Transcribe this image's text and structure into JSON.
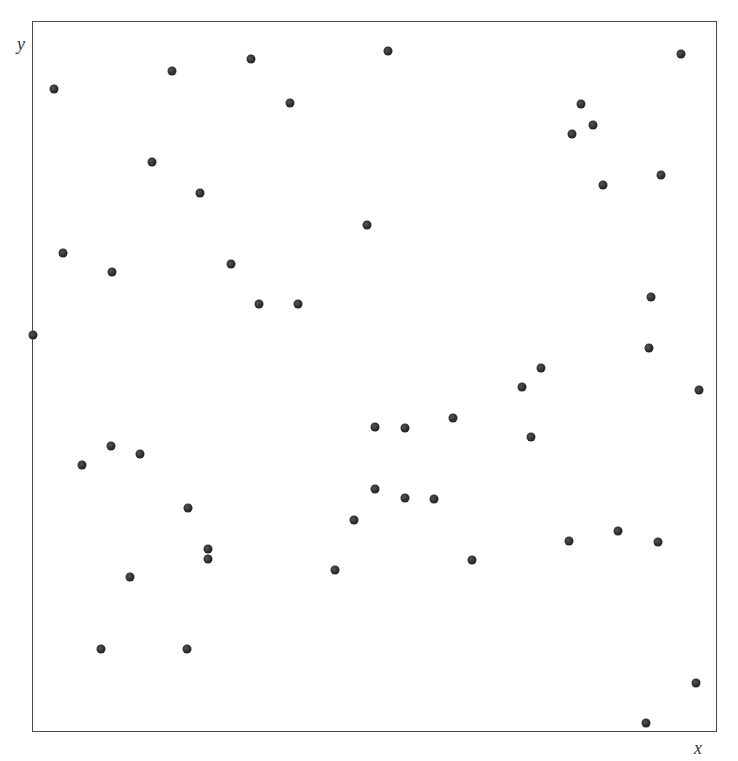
{
  "chart_data": {
    "type": "scatter",
    "title": "",
    "xlabel": "x",
    "ylabel": "y",
    "xlim": [
      0,
      1
    ],
    "ylim": [
      0,
      1
    ],
    "grid": false,
    "legend": null,
    "ticks": {
      "x": [],
      "y": []
    },
    "marker": {
      "shape": "circle",
      "color": "#2a2a2a",
      "size_px": 9
    },
    "frame": {
      "left": 32,
      "top": 21,
      "width": 685,
      "height": 711,
      "border_color": "#4a4a4a"
    },
    "points": [
      {
        "x": 0.032,
        "y": 0.904
      },
      {
        "x": 0.204,
        "y": 0.93
      },
      {
        "x": 0.32,
        "y": 0.947
      },
      {
        "x": 0.377,
        "y": 0.885
      },
      {
        "x": 0.175,
        "y": 0.802
      },
      {
        "x": 0.245,
        "y": 0.758
      },
      {
        "x": 0.489,
        "y": 0.713
      },
      {
        "x": 0.045,
        "y": 0.674
      },
      {
        "x": 0.117,
        "y": 0.647
      },
      {
        "x": 0.291,
        "y": 0.658
      },
      {
        "x": 0.331,
        "y": 0.602
      },
      {
        "x": 0.388,
        "y": 0.602
      },
      {
        "x": 0.52,
        "y": 0.958
      },
      {
        "x": 0.947,
        "y": 0.954
      },
      {
        "x": 0.801,
        "y": 0.883
      },
      {
        "x": 0.819,
        "y": 0.854
      },
      {
        "x": 0.788,
        "y": 0.841
      },
      {
        "x": 0.918,
        "y": 0.783
      },
      {
        "x": 0.834,
        "y": 0.769
      },
      {
        "x": 0.904,
        "y": 0.612
      },
      {
        "x": 0.001,
        "y": 0.558
      },
      {
        "x": 0.115,
        "y": 0.402
      },
      {
        "x": 0.158,
        "y": 0.391
      },
      {
        "x": 0.073,
        "y": 0.376
      },
      {
        "x": 0.228,
        "y": 0.315
      },
      {
        "x": 0.47,
        "y": 0.298
      },
      {
        "x": 0.257,
        "y": 0.257
      },
      {
        "x": 0.257,
        "y": 0.243
      },
      {
        "x": 0.442,
        "y": 0.228
      },
      {
        "x": 0.143,
        "y": 0.218
      },
      {
        "x": 0.901,
        "y": 0.54
      },
      {
        "x": 0.743,
        "y": 0.512
      },
      {
        "x": 0.715,
        "y": 0.485
      },
      {
        "x": 0.974,
        "y": 0.481
      },
      {
        "x": 0.615,
        "y": 0.442
      },
      {
        "x": 0.501,
        "y": 0.429
      },
      {
        "x": 0.545,
        "y": 0.428
      },
      {
        "x": 0.728,
        "y": 0.415
      },
      {
        "x": 0.501,
        "y": 0.342
      },
      {
        "x": 0.545,
        "y": 0.329
      },
      {
        "x": 0.587,
        "y": 0.328
      },
      {
        "x": 0.855,
        "y": 0.283
      },
      {
        "x": 0.784,
        "y": 0.269
      },
      {
        "x": 0.914,
        "y": 0.267
      },
      {
        "x": 0.642,
        "y": 0.242
      },
      {
        "x": 0.101,
        "y": 0.117
      },
      {
        "x": 0.226,
        "y": 0.117
      },
      {
        "x": 0.969,
        "y": 0.069
      },
      {
        "x": 0.896,
        "y": 0.013
      }
    ],
    "point_count": 49
  },
  "axes": {
    "x_label": "x",
    "y_label": "y"
  }
}
